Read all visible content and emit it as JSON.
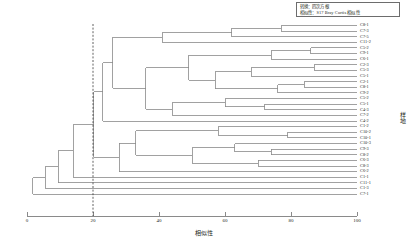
{
  "legend": {
    "transform_line": "转换：四次方根",
    "similarity_line": "相似性：S17 Bray Curtis 相似性"
  },
  "axes": {
    "x_title": "相似性",
    "y_title": "样地",
    "x_ticks": [
      "0",
      "20",
      "40",
      "60",
      "80",
      "100"
    ],
    "x_min": 0,
    "x_max": 100
  },
  "cut_line": {
    "value": 20,
    "style": "dashed"
  },
  "chart_data": {
    "type": "dendrogram",
    "title": "",
    "xlabel": "相似性",
    "ylabel": "样地",
    "xlim": [
      0,
      100
    ],
    "grid": false,
    "legend_position": "top-right",
    "annotations": [
      "转换：四次方根",
      "相似性：S17 Bray Curtis 相似性"
    ],
    "cut_value": 20,
    "leaves": [
      "C8-1",
      "C7-3",
      "C7-5",
      "C11-2",
      "C5-2",
      "C9-1",
      "C6-1",
      "C2-3",
      "C5-3",
      "C5-1",
      "C2-1",
      "C8-1",
      "C9-2",
      "C5-2",
      "C5-1",
      "C4-3",
      "C7-2",
      "C4-2",
      "C1-2",
      "C10-2",
      "C10-1",
      "C10-3",
      "C9-3",
      "C8-2",
      "C6-3",
      "C8-3",
      "C6-2",
      "C1-1",
      "C11-1",
      "C1-3",
      "C7-1"
    ],
    "merges": [
      {
        "height": 77,
        "members": [
          "C8-1",
          "C7-3"
        ]
      },
      {
        "height": 52,
        "members": [
          "C5-2",
          "C9-1"
        ]
      },
      {
        "height": 86,
        "members": [
          "C2-3",
          "C5-3"
        ]
      },
      {
        "height": 78,
        "members": [
          "C9-2",
          "C5-2"
        ]
      },
      {
        "height": 62,
        "members": [
          "C7-2",
          "C4-2"
        ]
      },
      {
        "height": 79,
        "members": [
          "C10-1",
          "C10-3"
        ]
      },
      {
        "height": 72,
        "members": [
          "C8-2",
          "C6-3"
        ]
      },
      {
        "height": 66,
        "members": [
          "C8-3",
          "C6-2"
        ]
      },
      {
        "height": 58,
        "members": [
          "C10-2",
          "C10-cluster"
        ]
      },
      {
        "height": 44,
        "members": [
          "C5-1",
          "C2-1"
        ]
      },
      {
        "height": 33,
        "members": [
          "mid-cluster-a",
          "mid-cluster-b"
        ]
      },
      {
        "height": 20,
        "members": [
          "upper-cluster",
          "lower-cluster"
        ]
      },
      {
        "height": 14,
        "members": [
          "main",
          "C11-1"
        ]
      },
      {
        "height": 9,
        "members": [
          "main2",
          "C1-3"
        ]
      },
      {
        "height": 4,
        "members": [
          "main3",
          "C7-1"
        ]
      }
    ]
  }
}
